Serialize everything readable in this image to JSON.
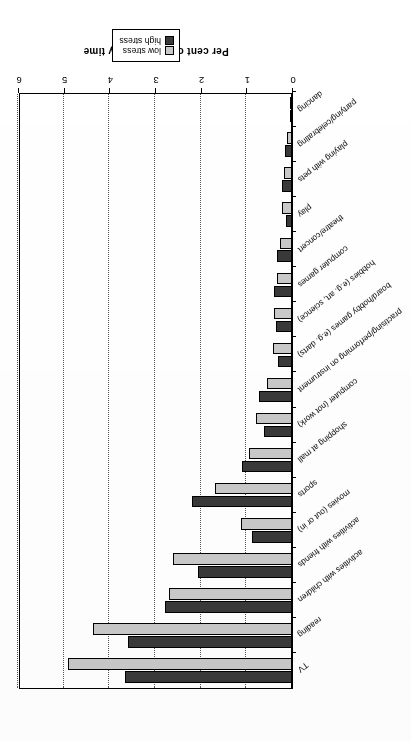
{
  "figure": {
    "orientation": "rotated-180",
    "legend": {
      "position": "top-left (as displayed)",
      "entries": [
        {
          "label": "low stress",
          "color": "#c9c9c9"
        },
        {
          "label": "high stress",
          "color": "#3a3a3a"
        }
      ]
    }
  },
  "chart_data": {
    "type": "bar",
    "orientation": "horizontal",
    "title": "",
    "xlabel": "Per cent of total activity time",
    "ylabel": "",
    "xlim": [
      0,
      6
    ],
    "xticks": [
      0,
      1,
      2,
      3,
      4,
      5,
      6
    ],
    "grid": true,
    "legend_position": "top-left",
    "categories": [
      "TV",
      "reading",
      "activities with children",
      "activities with friends",
      "movies (out or in)",
      "sports",
      "shopping at mall",
      "computer (not work)",
      "practising/performing on instrument",
      "board/hobby games (e.g. darts)",
      "hobbies (e.g. art, science)",
      "computer games",
      "theatre/concert",
      "play",
      "playing with pets",
      "partying/celebrating",
      "dancing"
    ],
    "series": [
      {
        "name": "low stress",
        "color": "#c9c9c9",
        "values": [
          4.9,
          4.35,
          2.7,
          2.6,
          1.12,
          1.68,
          0.95,
          0.78,
          0.55,
          0.42,
          0.4,
          0.32,
          0.26,
          0.22,
          0.18,
          0.1,
          0.04
        ]
      },
      {
        "name": "high stress",
        "color": "#3a3a3a",
        "values": [
          3.65,
          3.6,
          2.78,
          2.05,
          0.88,
          2.18,
          1.1,
          0.62,
          0.72,
          0.3,
          0.34,
          0.4,
          0.32,
          0.14,
          0.22,
          0.16,
          0.05
        ]
      }
    ]
  }
}
